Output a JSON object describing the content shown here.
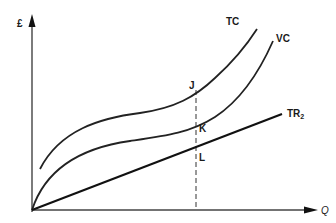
{
  "diagram": {
    "type": "economics-cost-revenue",
    "axes": {
      "y_label": "£",
      "x_label": "Q"
    },
    "curves": [
      {
        "id": "TC",
        "label": "TC",
        "description": "Total cost curve (cubic shape, starts above origin)"
      },
      {
        "id": "VC",
        "label": "VC",
        "description": "Variable cost curve (cubic shape, starts at origin)"
      },
      {
        "id": "TR2",
        "label": "TR",
        "label_sub": "2",
        "description": "Total revenue line from origin"
      }
    ],
    "points": [
      {
        "id": "J",
        "label": "J",
        "on": "TC"
      },
      {
        "id": "K",
        "label": "K",
        "on": "VC"
      },
      {
        "id": "L",
        "label": "L",
        "on": "TR2"
      }
    ],
    "dashed_line": {
      "description": "Vertical dashed line at output level through J, K, L down to Q axis"
    },
    "colors": {
      "line": "#1a1a1a",
      "axis": "#333333",
      "background": "#ffffff"
    }
  }
}
